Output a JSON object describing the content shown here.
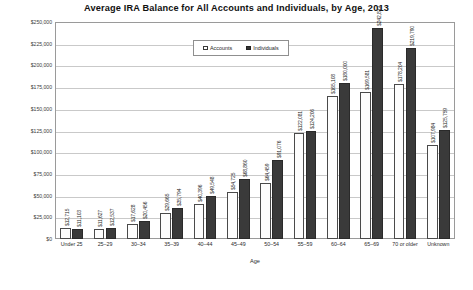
{
  "chart_data": {
    "type": "bar",
    "title": "Average IRA Balance for All Accounts and Individuals, by Age, 2013",
    "xlabel": "Age",
    "ylabel": "",
    "ylim": [
      0,
      250000
    ],
    "ytick_labels": [
      "$250,000",
      "$225,000",
      "$200,000",
      "$175,000",
      "$150,000",
      "$125,000",
      "$100,000",
      "$75,000",
      "$50,000",
      "$25,000",
      "$0"
    ],
    "ytick_values": [
      250000,
      225000,
      200000,
      175000,
      150000,
      125000,
      100000,
      75000,
      50000,
      25000,
      0
    ],
    "grid": true,
    "legend_position": "top-center",
    "categories": [
      "Under 25",
      "25–29",
      "30–34",
      "35–39",
      "40–44",
      "45–49",
      "50–54",
      "55–59",
      "60–64",
      "65–69",
      "70 or older",
      "Unknown"
    ],
    "series": [
      {
        "name": "Accounts",
        "color": "#ffffff",
        "values": [
          12715,
          11627,
          17628,
          29665,
          40396,
          54725,
          64459,
          122081,
          165108,
          169581,
          178204,
          107984
        ],
        "labels": [
          "$12,715",
          "$11,627",
          "$17,628",
          "$29,665",
          "$40,396",
          "$54,725",
          "$64,459",
          "$122,081",
          "$165,108",
          "$169,581",
          "$178,204",
          "$107,984"
        ]
      },
      {
        "name": "Individuals",
        "color": "#333333",
        "values": [
          11103,
          12537,
          20456,
          35794,
          49548,
          68860,
          91076,
          124206,
          180000,
          242812,
          219790,
          125759
        ],
        "labels": [
          "$11,103",
          "$12,537",
          "$20,456",
          "$35,794",
          "$49,548",
          "$68,860",
          "$91,076",
          "$124,206",
          "$180,000",
          "$242,812",
          "$219,790",
          "$125,759"
        ]
      }
    ]
  }
}
